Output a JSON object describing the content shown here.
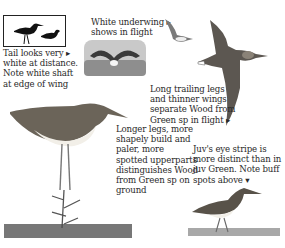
{
  "illustration": {
    "subject": "Wood Sandpiper identification plate",
    "captions": [
      {
        "id": "tail",
        "text": "Tail looks very ▸\nwhite at distance.\nNote white shaft\nat edge of wing"
      },
      {
        "id": "underwing",
        "text": "White underwing ▸\nshows in flight"
      },
      {
        "id": "flight",
        "text": "Long trailing legs\nand thinner wings\nseparate Wood from\nGreen sp in flight ▸"
      },
      {
        "id": "ground",
        "text": "Longer legs, more\nshapely build and\npaler, more\nspotted upperparts\ndistinguishes Wood\nfrom Green sp on\nground"
      },
      {
        "id": "juvenile",
        "text": "Juv's eye stripe is\nmore distinct than in\njuv Green. Note buff\nspots above ▾"
      }
    ],
    "figures": [
      {
        "id": "silhouettes",
        "description": "two bird silhouettes in box"
      },
      {
        "id": "wading-bird",
        "description": "bird in water with wings raised"
      },
      {
        "id": "flying-small",
        "description": "small bird in flight"
      },
      {
        "id": "flying-large",
        "description": "large bird in flight, underside"
      },
      {
        "id": "standing-adult",
        "description": "adult standing on twig"
      },
      {
        "id": "juvenile-walking",
        "description": "juvenile walking on grass"
      }
    ],
    "colors": {
      "ink": "#2a2a2a",
      "paper": "#ffffff",
      "plumage": "#6b6459",
      "belly": "#f2efe8"
    }
  }
}
